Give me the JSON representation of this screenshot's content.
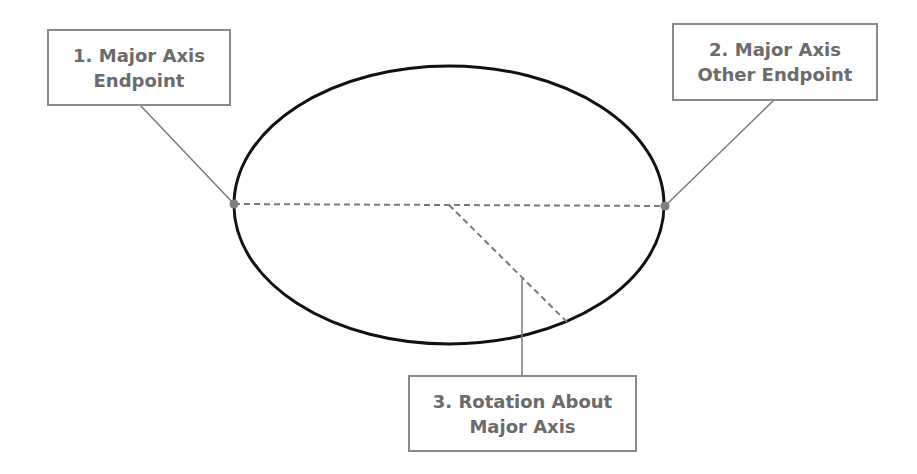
{
  "diagram": {
    "colors": {
      "ellipse": "#111111",
      "leader": "#7a7a7a",
      "dashed": "#7a7a7a",
      "point": "#7f7f7f",
      "box_border": "#8a8a8a",
      "text": "#6b6b6b"
    },
    "ellipse": {
      "cx": 449,
      "cy": 205,
      "rx": 216,
      "ry": 140
    },
    "points": [
      {
        "name": "major-axis-endpoint-1",
        "x": 234,
        "y": 204
      },
      {
        "name": "major-axis-endpoint-2",
        "x": 665,
        "y": 206
      }
    ],
    "labels": [
      {
        "id": "step-1",
        "line1": "1. Major Axis",
        "line2": "Endpoint"
      },
      {
        "id": "step-2",
        "line1": "2. Major Axis",
        "line2": "Other Endpoint"
      },
      {
        "id": "step-3",
        "line1": "3. Rotation About",
        "line2": "Major Axis"
      }
    ]
  }
}
